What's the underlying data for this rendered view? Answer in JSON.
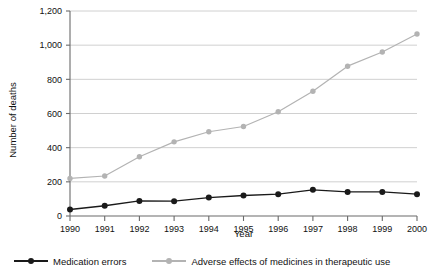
{
  "chart_data": {
    "type": "line",
    "title": "",
    "xlabel": "Year",
    "ylabel": "Number of deaths",
    "x": [
      1990,
      1991,
      1992,
      1993,
      1994,
      1995,
      1996,
      1997,
      1998,
      1999,
      2000
    ],
    "xticklabels": [
      "1990",
      "1991",
      "1992",
      "1993",
      "1994",
      "1995",
      "1996",
      "1997",
      "1998",
      "1999",
      "2000"
    ],
    "yticks": [
      0,
      200,
      400,
      600,
      800,
      1000,
      1200
    ],
    "yticklabels": [
      "0",
      "200",
      "400",
      "600",
      "800",
      "1,000",
      "1,200"
    ],
    "ylim": [
      0,
      1200
    ],
    "grid": "horizontal",
    "legend_position": "bottom",
    "series": [
      {
        "name": "Medication errors",
        "color": "#1a1a1a",
        "marker": "circle",
        "values": [
          38,
          60,
          88,
          87,
          108,
          120,
          128,
          153,
          141,
          141,
          128
        ]
      },
      {
        "name": "Adverse effects of medicines in therapeutic use",
        "color": "#b3b3b3",
        "marker": "circle",
        "values": [
          220,
          234,
          347,
          434,
          493,
          524,
          610,
          730,
          877,
          960,
          1065
        ]
      }
    ]
  },
  "legend": {
    "entries": [
      {
        "label": "Medication errors"
      },
      {
        "label": "Adverse effects of medicines in therapeutic use"
      }
    ]
  },
  "axes": {
    "x_title": "Year",
    "y_title": "Number of deaths"
  },
  "colors": {
    "series_dark": "#1a1a1a",
    "series_light": "#b3b3b3",
    "grid": "#d0d0d0",
    "axis": "#6a6a6a",
    "text": "#111111",
    "background": "#ffffff"
  }
}
